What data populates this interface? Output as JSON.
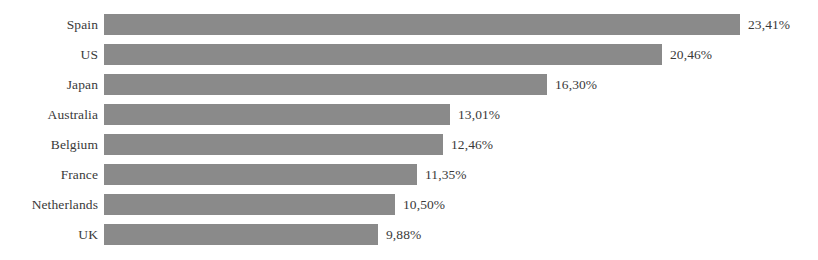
{
  "chart_data": {
    "type": "bar",
    "orientation": "horizontal",
    "title": "",
    "subtitle": "",
    "xlabel": "",
    "ylabel": "",
    "grid": false,
    "legend": null,
    "axis_visible": false,
    "value_suffix": "%",
    "decimal_separator": ",",
    "xlim": [
      0,
      23.41
    ],
    "categories": [
      "Spain",
      "US",
      "Japan",
      "Australia",
      "Belgium",
      "France",
      "Netherlands",
      "UK"
    ],
    "values": [
      23.41,
      20.46,
      16.3,
      13.01,
      12.46,
      11.35,
      10.5,
      9.88
    ],
    "value_labels": [
      "23,41%",
      "20,46%",
      "16,30%",
      "13,01%",
      "12,46%",
      "11,35%",
      "10,50%",
      "9,88%"
    ],
    "bar_pixel_widths": [
      636,
      558,
      443,
      346,
      339,
      313,
      291,
      274
    ],
    "bar_color": "#8a8a8a",
    "text_color": "#3a3a3a",
    "background_color": "#ffffff"
  }
}
